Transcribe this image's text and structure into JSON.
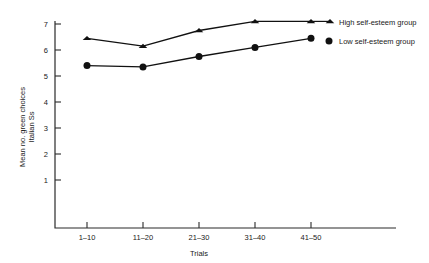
{
  "chart_data": {
    "type": "line",
    "title": "",
    "xlabel": "Trials",
    "ylabel": "Mean no. green choices Italian Ss",
    "ylabel_line1": "Mean no. green choices",
    "ylabel_line2": "Italian Ss",
    "categories": [
      "1–10",
      "11–20",
      "21–30",
      "31–40",
      "41–50"
    ],
    "xtick_labels": [
      "1–10",
      "11–20",
      "21–30",
      "31–40",
      "41–50"
    ],
    "ytick_labels": [
      "1",
      "2",
      "3",
      "4",
      "5",
      "6",
      "7"
    ],
    "ytick_values": [
      1,
      2,
      3,
      4,
      5,
      6,
      7
    ],
    "ylim": [
      0,
      7.4
    ],
    "grid": false,
    "legend_position": "right",
    "series": [
      {
        "name": "High self-esteem group",
        "marker": "triangle",
        "color": "#111111",
        "values": [
          6.45,
          6.15,
          6.75,
          7.1,
          7.1
        ]
      },
      {
        "name": "Low self-esteem group",
        "marker": "circle",
        "color": "#111111",
        "values": [
          5.4,
          5.35,
          5.75,
          6.1,
          6.45
        ]
      }
    ],
    "legend": [
      {
        "label": "High self-esteem group",
        "marker": "triangle"
      },
      {
        "label": "Low self-esteem group",
        "marker": "circle"
      }
    ]
  },
  "axes": {
    "y_tick_1": "1",
    "y_tick_2": "2",
    "y_tick_3": "3",
    "y_tick_4": "4",
    "y_tick_5": "5",
    "y_tick_6": "6",
    "y_tick_7": "7",
    "x_tick_1": "1–10",
    "x_tick_2": "11–20",
    "x_tick_3": "21–30",
    "x_tick_4": "31–40",
    "x_tick_5": "41–50",
    "x_axis_title": "Trials",
    "y_axis_title_line1": "Mean no. green choices",
    "y_axis_title_line2": "Italian Ss"
  },
  "legend": {
    "high_label": "High self-esteem group",
    "low_label": "Low self-esteem group"
  },
  "colors": {
    "ink": "#111111",
    "axis": "#2b2b2b",
    "background": "#ffffff"
  }
}
